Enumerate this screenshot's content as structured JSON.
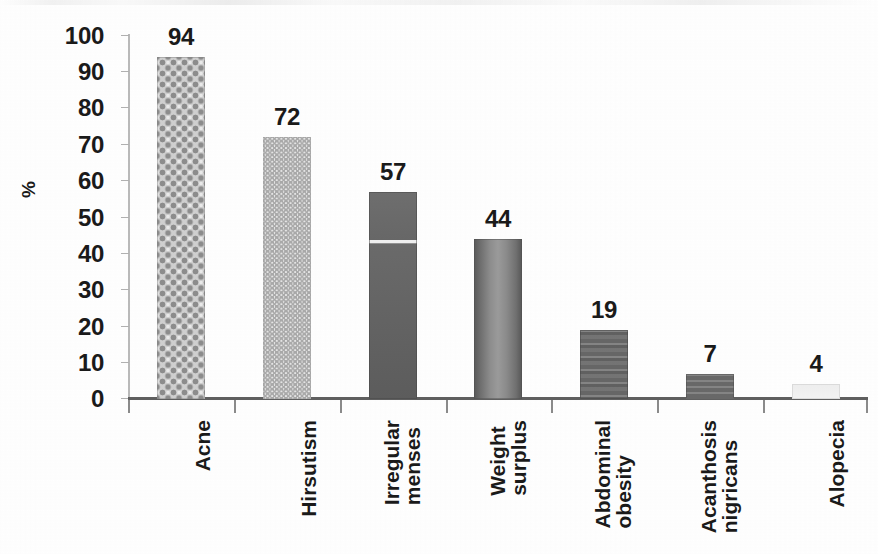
{
  "chart_data": {
    "type": "bar",
    "title": "",
    "subtitle": "",
    "xlabel": "",
    "ylabel": "%",
    "ylim": [
      0,
      100
    ],
    "ytick_step": 10,
    "grid": false,
    "legend": false,
    "orientation": "vertical",
    "category_label_rotation": -90,
    "categories": [
      "Acne",
      "Hirsutism",
      "Irregular menses",
      "Weight surplus",
      "Abdominal obesity",
      "Acanthosis nigricans",
      "Alopecia"
    ],
    "category_lines": [
      [
        "Acne"
      ],
      [
        "Hirsutism"
      ],
      [
        "Irregular",
        "menses"
      ],
      [
        "Weight",
        "surplus"
      ],
      [
        "Abdominal",
        "obesity"
      ],
      [
        "Acanthosis",
        "nigricans"
      ],
      [
        "Alopecia"
      ]
    ],
    "values": [
      94,
      72,
      57,
      44,
      19,
      7,
      4
    ],
    "value_labels": [
      "94",
      "72",
      "57",
      "44",
      "19",
      "7",
      "4"
    ],
    "ytick_labels": [
      "0",
      "10",
      "20",
      "30",
      "40",
      "50",
      "60",
      "70",
      "80",
      "90",
      "100"
    ],
    "bar_fills": [
      "diamond-checker-gray",
      "zigzag-weave-light-gray",
      "solid-dark-gray-with-seam",
      "cylinder-gradient-gray",
      "banded-dark-gray",
      "dark-gray",
      "very-pale-gray"
    ]
  },
  "axis": {
    "y_title": "%",
    "y_ticks": [
      "100",
      "90",
      "80",
      "70",
      "60",
      "50",
      "40",
      "30",
      "20",
      "10",
      "0"
    ]
  },
  "colors": {
    "background": "#ffffff",
    "text": "#1a1a1a",
    "axis_line": "#5f5f5f",
    "y_axis_line": "#b9b9b9",
    "bar_dark": "#6b6b6b",
    "bar_mid": "#9a9a9a",
    "bar_light": "#cfcfcf",
    "bar_pale": "#efefef"
  }
}
